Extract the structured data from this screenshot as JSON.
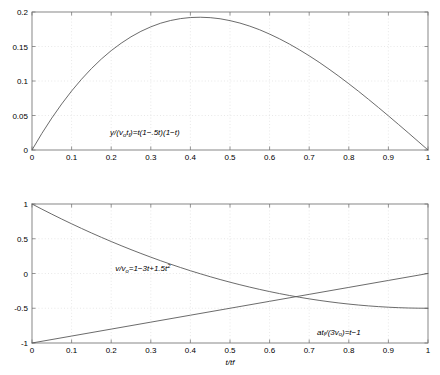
{
  "figure": {
    "width": 440,
    "height": 375,
    "background": "#ffffff",
    "axis_color": "#7a7a7a",
    "grid_color": "#d8d8d8",
    "curve_color": "#5a5a5a"
  },
  "chart_data": [
    {
      "type": "line",
      "id": "position-plot",
      "title": "",
      "xlabel": "",
      "ylabel": "",
      "xlim": [
        0,
        1
      ],
      "ylim": [
        0,
        0.2
      ],
      "grid": true,
      "legend": "none",
      "xticks": [
        0,
        0.1,
        0.2,
        0.3,
        0.4,
        0.5,
        0.6,
        0.7,
        0.8,
        0.9,
        1
      ],
      "xticklabels": [
        "0",
        "0.1",
        "0.2",
        "0.3",
        "0.4",
        "0.5",
        "0.6",
        "0.7",
        "0.8",
        "0.9",
        "1"
      ],
      "yticks": [
        0,
        0.05,
        0.1,
        0.15,
        0.2
      ],
      "yticklabels": [
        "0",
        "0.05",
        "0.1",
        "0.15",
        "0.2"
      ],
      "annotations": [
        {
          "id": "position-equation",
          "text": "y/(v t )=t(1-.5t)(1-t)",
          "text_parts": [
            "y/(v",
            "o",
            "t",
            "f",
            ")=t(1−.5t)(1−t)"
          ],
          "x": 0.285,
          "y": 0.108
        }
      ],
      "series": [
        {
          "name": "y/(vo tf) = t(1-.5t)(1-t)",
          "x": [
            0,
            0.025,
            0.05,
            0.075,
            0.1,
            0.125,
            0.15,
            0.175,
            0.2,
            0.225,
            0.25,
            0.275,
            0.3,
            0.325,
            0.35,
            0.375,
            0.4,
            0.425,
            0.45,
            0.475,
            0.5,
            0.525,
            0.55,
            0.575,
            0.6,
            0.625,
            0.65,
            0.675,
            0.7,
            0.725,
            0.75,
            0.775,
            0.8,
            0.825,
            0.85,
            0.875,
            0.9,
            0.925,
            0.95,
            0.975,
            1
          ],
          "values": [
            0,
            0.02408,
            0.04691,
            0.06852,
            0.08888,
            0.10801,
            0.12591,
            0.14258,
            0.158,
            0.1722,
            0.18516,
            0.19689,
            0.20738,
            0.21664,
            0.22466,
            0.23145,
            0.237,
            0.24132,
            0.2444,
            0.24625,
            0.24688,
            0.24625,
            0.2444,
            0.24132,
            0.237,
            0.23145,
            0.22466,
            0.21664,
            0.20738,
            0.19689,
            0.18516,
            0.1722,
            0.158,
            0.14258,
            0.12591,
            0.10801,
            0.08888,
            0.06852,
            0.04691,
            0.02408,
            0
          ],
          "values_actual": [
            0,
            0.02409,
            0.04631,
            0.06672,
            0.0855,
            0.10254,
            0.11794,
            0.13178,
            0.144,
            0.15469,
            0.16406,
            0.17195,
            0.1785,
            0.18379,
            0.18769,
            0.19043,
            0.192,
            0.19241,
            0.19181,
            0.19022,
            0.1875,
            0.18397,
            0.1795,
            0.17422,
            0.168,
            0.16113,
            0.15356,
            0.14531,
            0.1365,
            0.12719,
            0.11719,
            0.10684,
            0.096,
            0.08488,
            0.07331,
            0.06152,
            0.0495,
            0.03727,
            0.025,
            0.0125,
            0
          ]
        }
      ]
    },
    {
      "type": "line",
      "id": "velocity-acceleration-plot",
      "title": "",
      "xlabel": "t/tf",
      "ylabel": "",
      "xlim": [
        0,
        1
      ],
      "ylim": [
        -1,
        1
      ],
      "grid": true,
      "legend": "none",
      "xticks": [
        0,
        0.1,
        0.2,
        0.3,
        0.4,
        0.5,
        0.6,
        0.7,
        0.8,
        0.9,
        1
      ],
      "xticklabels": [
        "0",
        "0.1",
        "0.2",
        "0.3",
        "0.4",
        "0.5",
        "0.6",
        "0.7",
        "0.8",
        "0.9",
        "1"
      ],
      "yticks": [
        -1,
        -0.5,
        0,
        0.5,
        1
      ],
      "yticklabels": [
        "-1",
        "-0.5",
        "0",
        "0.5",
        "1"
      ],
      "annotations": [
        {
          "id": "velocity-equation",
          "text": "v/v =1-3t+1.5t2",
          "text_parts": [
            "v/v",
            "o",
            "=1−3t+1.5t",
            "2"
          ],
          "x": 0.28,
          "y": 0.52
        },
        {
          "id": "acceleration-equation",
          "text": "atf/(3vo)=t-1",
          "text_parts": [
            "at",
            "f",
            "/(3v",
            "o",
            ")=t−1"
          ],
          "x": 0.775,
          "y": 0.06
        }
      ],
      "series": [
        {
          "name": "v/vo = 1-3t+1.5t^2",
          "x": [
            0,
            0.025,
            0.05,
            0.075,
            0.1,
            0.125,
            0.15,
            0.175,
            0.2,
            0.225,
            0.25,
            0.275,
            0.3,
            0.325,
            0.35,
            0.375,
            0.4,
            0.425,
            0.45,
            0.475,
            0.5,
            0.525,
            0.55,
            0.575,
            0.6,
            0.625,
            0.65,
            0.675,
            0.7,
            0.725,
            0.75,
            0.775,
            0.8,
            0.825,
            0.85,
            0.875,
            0.9,
            0.925,
            0.95,
            0.975,
            1
          ],
          "values": [
            1,
            0.92594,
            0.85375,
            0.78344,
            0.715,
            0.64844,
            0.58375,
            0.52094,
            0.46,
            0.40094,
            0.34375,
            0.28844,
            0.235,
            0.18344,
            0.13375,
            0.08594,
            0.04,
            -0.00406,
            -0.04625,
            -0.08656,
            -0.125,
            -0.16156,
            -0.19625,
            -0.22906,
            -0.26,
            -0.28906,
            -0.31625,
            -0.34156,
            -0.365,
            -0.38656,
            -0.40625,
            -0.42406,
            -0.44,
            -0.45406,
            -0.46625,
            -0.47656,
            -0.485,
            -0.49156,
            -0.49625,
            -0.49906,
            -0.5
          ]
        },
        {
          "name": "a tf/(3 vo) = t-1",
          "x": [
            0,
            0.1,
            0.2,
            0.3,
            0.4,
            0.5,
            0.6,
            0.7,
            0.8,
            0.9,
            1
          ],
          "values": [
            -1,
            -0.9,
            -0.8,
            -0.7,
            -0.6,
            -0.5,
            -0.4,
            -0.3,
            -0.2,
            -0.1,
            0
          ]
        }
      ],
      "intersection": {
        "x": 0.667,
        "y": -0.333
      }
    }
  ]
}
